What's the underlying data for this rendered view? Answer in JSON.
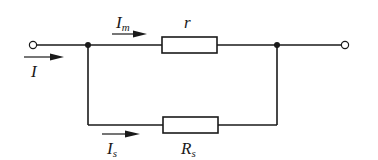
{
  "diagram": {
    "type": "circuit",
    "title": "",
    "colors": {
      "wire": "#1a1a1a",
      "background": "#ffffff"
    },
    "labels": {
      "total_current": {
        "main": "I",
        "sub": ""
      },
      "meter_current": {
        "main": "I",
        "sub": "m"
      },
      "meter_resistance": {
        "main": "r",
        "sub": ""
      },
      "shunt_current": {
        "main": "I",
        "sub": "s"
      },
      "shunt_resistance": {
        "main": "R",
        "sub": "s"
      }
    },
    "components": [
      {
        "id": "r",
        "kind": "resistor",
        "label": "r",
        "branch": "top"
      },
      {
        "id": "Rs",
        "kind": "resistor",
        "label": "Rs",
        "branch": "bottom"
      }
    ],
    "nodes": [
      {
        "id": "left-terminal",
        "kind": "open-terminal"
      },
      {
        "id": "left-junction",
        "kind": "junction"
      },
      {
        "id": "right-junction",
        "kind": "junction"
      },
      {
        "id": "right-terminal",
        "kind": "open-terminal"
      }
    ],
    "arrows": [
      {
        "id": "I",
        "direction": "right"
      },
      {
        "id": "Im",
        "direction": "right"
      },
      {
        "id": "Is",
        "direction": "right"
      }
    ]
  }
}
